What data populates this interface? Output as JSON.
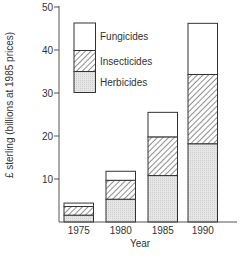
{
  "chart_data": {
    "type": "bar",
    "stacked": true,
    "title": "",
    "xlabel": "Year",
    "ylabel": "£ sterling (billions at 1985 prices)",
    "categories": [
      "1975",
      "1980",
      "1985",
      "1990"
    ],
    "series": [
      {
        "name": "Herbicides",
        "pattern": "dotted-grey",
        "values": [
          1.6,
          5.3,
          10.8,
          18.2
        ]
      },
      {
        "name": "Insecticides",
        "pattern": "diagonal-hatch",
        "values": [
          2.0,
          4.4,
          9.0,
          16.1
        ]
      },
      {
        "name": "Fungicides",
        "pattern": "white",
        "values": [
          0.8,
          2.1,
          5.7,
          11.9
        ]
      }
    ],
    "totals": [
      4.4,
      11.8,
      25.5,
      46.2
    ],
    "ylim": [
      0,
      50
    ],
    "yticks": [
      10,
      20,
      30,
      40,
      50
    ],
    "grid": false,
    "legend": {
      "position": "upper-left",
      "entries": [
        "Fungicides",
        "Insecticides",
        "Herbicides"
      ]
    }
  }
}
